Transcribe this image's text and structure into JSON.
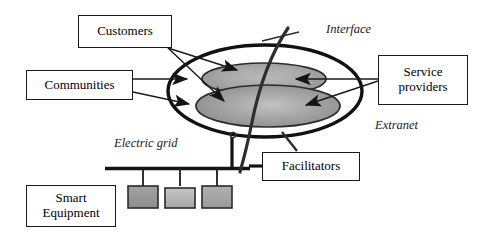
{
  "diagram": {
    "background_color": "#ffffff",
    "stroke_color": "#1a1a1a",
    "boxes": [
      {
        "id": "customers",
        "label": "Customers"
      },
      {
        "id": "communities",
        "label": "Communities"
      },
      {
        "id": "service",
        "label": "Service\nproviders"
      },
      {
        "id": "facilitators",
        "label": "Facilitators"
      },
      {
        "id": "smart",
        "label": "Smart\nEquipment"
      }
    ],
    "annotations": [
      {
        "id": "interface",
        "label": "Interface"
      },
      {
        "id": "extranet",
        "label": "Extranet"
      },
      {
        "id": "grid",
        "label": "Electric grid"
      }
    ],
    "shapes": {
      "outer_ellipse_name": "extranet-boundary-ellipse",
      "upper_inner_ellipse_name": "upper-inner-ellipse",
      "lower_inner_ellipse_name": "lower-inner-ellipse",
      "interface_curve_name": "interface-curve",
      "grid_bar_name": "electric-grid-bar",
      "equipment_count": 3,
      "ellipse_fill": "#9c9c9c",
      "equipment_fill": "#9a9a9a"
    }
  }
}
